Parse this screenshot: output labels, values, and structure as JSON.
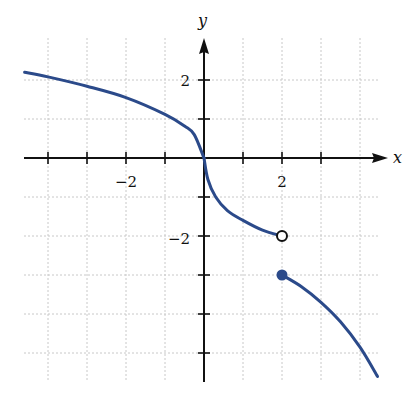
{
  "chart_data": {
    "type": "line",
    "title": "",
    "xlabel": "x",
    "ylabel": "y",
    "xlim": [
      -4.6,
      4.8
    ],
    "ylim": [
      -5.7,
      3.0
    ],
    "grid": true,
    "x_ticks": [
      -4,
      -3,
      -2,
      -1,
      1,
      2,
      3
    ],
    "y_ticks": [
      -5,
      -4,
      -3,
      -2,
      -1,
      1,
      2
    ],
    "x_tick_labels": [
      {
        "value": -2,
        "label": "−2"
      },
      {
        "value": 2,
        "label": "2"
      }
    ],
    "y_tick_labels": [
      {
        "value": 2,
        "label": "2"
      },
      {
        "value": -2,
        "label": "−2"
      }
    ],
    "series": [
      {
        "name": "left branch",
        "color": "#2b4a8a",
        "x": [
          -4.6,
          -4,
          -3,
          -2,
          -1,
          -0.5,
          -0.25,
          0
        ],
        "y": [
          2.2,
          2.08,
          1.84,
          1.55,
          1.12,
          0.82,
          0.6,
          0
        ]
      },
      {
        "name": "middle branch",
        "color": "#2b4a8a",
        "x": [
          0,
          0.1,
          0.3,
          0.6,
          1,
          1.5,
          2
        ],
        "y": [
          0,
          -0.55,
          -1.0,
          -1.35,
          -1.6,
          -1.85,
          -2.0
        ]
      },
      {
        "name": "right branch",
        "color": "#2b4a8a",
        "x": [
          2,
          2.5,
          3,
          3.5,
          4,
          4.45
        ],
        "y": [
          -3.0,
          -3.3,
          -3.7,
          -4.2,
          -4.85,
          -5.6
        ]
      }
    ],
    "points": [
      {
        "x": 2,
        "y": -2,
        "style": "open",
        "annotation": "open circle"
      },
      {
        "x": 2,
        "y": -3,
        "style": "filled",
        "annotation": "closed circle"
      }
    ],
    "annotations": [
      "jump discontinuity at x = 2"
    ]
  },
  "axes": {
    "x_label": "x",
    "y_label": "y",
    "tick_x_neg2": "−2",
    "tick_x_2": "2",
    "tick_y_2": "2",
    "tick_y_neg2": "−2"
  },
  "colors": {
    "curve": "#2b4a8a",
    "axis": "#111111",
    "grid": "#c8c8c8"
  }
}
